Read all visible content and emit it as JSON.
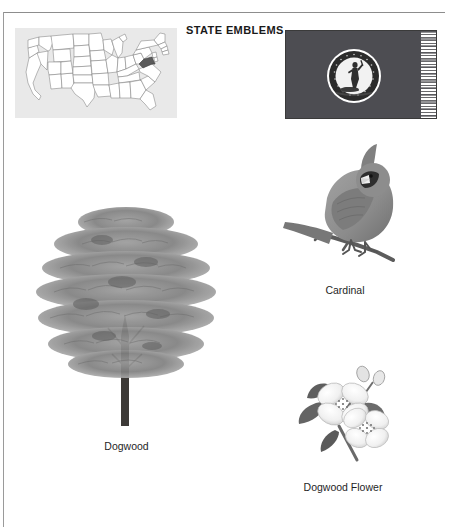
{
  "page": {
    "title": "STATE EMBLEMS",
    "width": 449,
    "height": 527,
    "background": "#ffffff"
  },
  "header": {
    "section_title": "STATE EMBLEMS"
  },
  "map": {
    "name": "united-states-map",
    "panel_color": "#e9e9e9",
    "outline_color": "#6b6b6b",
    "highlight_state": "Virginia",
    "highlight_color": "#5a5a5a"
  },
  "flag": {
    "name": "virginia-state-flag",
    "field_color": "#4d4d52",
    "border_color": "#3a3a3a",
    "seal_ring_color": "#2b2b2b",
    "seal_center_color": "#f4f4f4",
    "fringe_color": "#ffffff"
  },
  "figures": [
    {
      "id": "tree",
      "icon": "dogwood-tree-image",
      "caption": "Dogwood",
      "foliage_color": "#8a8a8a",
      "trunk_color": "#3d3a37"
    },
    {
      "id": "bird",
      "icon": "cardinal-bird-image",
      "caption": "Cardinal",
      "body_color": "#8f8f8f",
      "accent_color": "#3a3a3a"
    },
    {
      "id": "flower",
      "icon": "dogwood-flower-image",
      "caption": "Dogwood Flower",
      "petal_color": "#f2f2f2",
      "leaf_color": "#6d6d6d"
    }
  ]
}
